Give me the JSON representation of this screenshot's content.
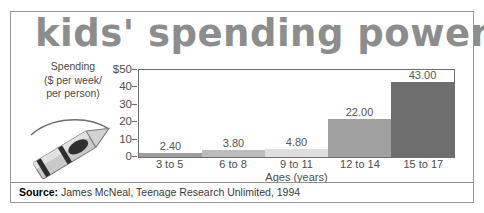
{
  "figure": {
    "title": "kids' spending power",
    "title_color": "#8d8d8d",
    "border_color": "#9a9a9a",
    "background": "#ffffff"
  },
  "source": {
    "label": "Source:",
    "text": "James McNeal, Teenage Research Unlimited, 1994"
  },
  "illustration": {
    "name": "crayon-illustration",
    "description": "crayon with curved arc"
  },
  "chart_data": {
    "type": "bar",
    "title": "kids' spending power",
    "categories": [
      "3 to 5",
      "6 to 8",
      "9 to 11",
      "12 to 14",
      "15 to 17"
    ],
    "values": [
      2.4,
      3.8,
      4.8,
      22.0,
      43.0
    ],
    "value_labels": [
      "2.40",
      "3.80",
      "4.80",
      "22.00",
      "43.00"
    ],
    "bar_colors": [
      "#9f9f9f",
      "#bcbcbc",
      "#dedede",
      "#a0a0a0",
      "#6e6e6e"
    ],
    "xlabel": "Ages (years)",
    "ylabel_lines": [
      "Spending",
      "($ per week/",
      "per person)"
    ],
    "ylim": [
      0,
      50
    ],
    "yticks": [
      0,
      10,
      20,
      30,
      40,
      50
    ],
    "ytick_labels": [
      "0",
      "10",
      "20",
      "30",
      "40",
      "$50"
    ],
    "grid": false,
    "legend": "none"
  }
}
